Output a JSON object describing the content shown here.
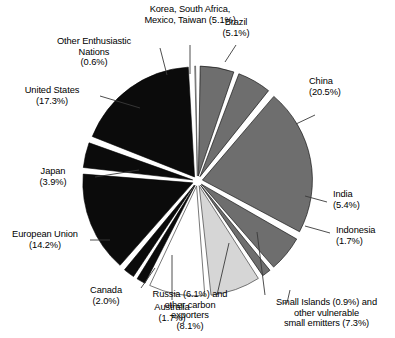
{
  "chart_data": {
    "type": "pie",
    "title": "",
    "subtitle": "",
    "xlabel": "",
    "ylabel": "",
    "legend_position": "callout-labels",
    "grid": false,
    "exploded": true,
    "units": "percent",
    "total": 100,
    "categories": [
      "Korea, South Africa, Mexico, Taiwan",
      "Brazil",
      "China",
      "India",
      "Indonesia",
      "Small Islands and other vulnerable small emitters",
      "Russia and other carbon exporters",
      "Australia",
      "Canada",
      "European Union",
      "Japan",
      "United States",
      "Other Enthusiastic Nations"
    ],
    "values": [
      5.1,
      5.1,
      20.5,
      5.4,
      1.7,
      7.3,
      8.1,
      1.7,
      2.0,
      14.2,
      3.9,
      17.3,
      0.6
    ],
    "slices": [
      {
        "key": "korea-group",
        "label": "Korea, South Africa,\nMexico, Taiwan (5.1%)",
        "value": 5.1,
        "color": "#6e6e6e",
        "stroke": "#000000"
      },
      {
        "key": "brazil",
        "label": "Brazil\n(5.1%)",
        "value": 5.1,
        "color": "#6e6e6e",
        "stroke": "#000000"
      },
      {
        "key": "china",
        "label": "China\n(20.5%)",
        "value": 20.5,
        "color": "#6e6e6e",
        "stroke": "#000000"
      },
      {
        "key": "india",
        "label": "India\n(5.4%)",
        "value": 5.4,
        "color": "#6e6e6e",
        "stroke": "#000000"
      },
      {
        "key": "indonesia",
        "label": "Indonesia\n(1.7%)",
        "value": 1.7,
        "color": "#6e6e6e",
        "stroke": "#000000"
      },
      {
        "key": "small-islands",
        "label": "Small Islands (0.9%) and\nother vulnerable\nsmall emitters (7.3%)",
        "value": 7.3,
        "color": "#d6d6d6",
        "stroke": "#555555"
      },
      {
        "key": "russia-group",
        "label": "Russia (6.1%) and\nother carbon\nexporters\n(8.1%)",
        "value": 8.1,
        "color": "#ffffff",
        "stroke": "#555555"
      },
      {
        "key": "australia",
        "label": "Australia\n(1.7%)",
        "value": 1.7,
        "color": "#0b0b0b",
        "stroke": "#000000"
      },
      {
        "key": "canada",
        "label": "Canada\n(2.0%)",
        "value": 2.0,
        "color": "#0b0b0b",
        "stroke": "#000000"
      },
      {
        "key": "european-union",
        "label": "European Union\n(14.2%)",
        "value": 14.2,
        "color": "#0b0b0b",
        "stroke": "#000000"
      },
      {
        "key": "japan",
        "label": "Japan\n(3.9%)",
        "value": 3.9,
        "color": "#0b0b0b",
        "stroke": "#000000"
      },
      {
        "key": "united-states",
        "label": "United States\n(17.3%)",
        "value": 17.3,
        "color": "#0b0b0b",
        "stroke": "#000000"
      },
      {
        "key": "other-enthusiastic-nations",
        "label": "Other Enthusiastic\nNations\n(0.6%)",
        "value": 0.6,
        "color": "#ffffff",
        "stroke": "#555555"
      }
    ]
  },
  "labels": {
    "korea_group": "Korea, South Africa,\nMexico, Taiwan (5.1%)",
    "brazil": "Brazil\n(5.1%)",
    "china": "China\n(20.5%)",
    "india": "India\n(5.4%)",
    "indonesia": "Indonesia\n(1.7%)",
    "small_islands": "Small Islands (0.9%) and\nother vulnerable\nsmall emitters (7.3%)",
    "russia_group": "Russia (6.1%) and\nother carbon\nexporters\n(8.1%)",
    "australia": "Australia\n(1.7%)",
    "canada": "Canada\n(2.0%)",
    "european_union": "European Union\n(14.2%)",
    "japan": "Japan\n(3.9%)",
    "united_states": "United States\n(17.3%)",
    "other_enthusiastic_nations": "Other Enthusiastic\nNations\n(0.6%)"
  },
  "colors": {
    "dark_gray": "#6e6e6e",
    "light_gray": "#d6d6d6",
    "black": "#0b0b0b",
    "white": "#ffffff",
    "text": "#000000",
    "leader_line": "#3a3a3a"
  }
}
